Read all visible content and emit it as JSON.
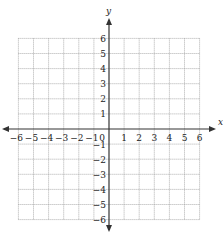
{
  "diagram": {
    "type": "coordinate-plane",
    "x_axis": {
      "label": "x",
      "min": -6,
      "max": 6,
      "ticks": [
        "-6",
        "-5",
        "-4",
        "-3",
        "-2",
        "-1",
        "1",
        "2",
        "3",
        "4",
        "5",
        "6"
      ],
      "origin_label": "0"
    },
    "y_axis": {
      "label": "y",
      "min": -6,
      "max": 6,
      "ticks": [
        "6",
        "5",
        "4",
        "3",
        "2",
        "1",
        "-1",
        "-2",
        "-3",
        "-4",
        "-5",
        "-6"
      ]
    },
    "grid": {
      "style": "dotted",
      "step": 1
    },
    "colors": {
      "axis": "#333333",
      "grid": "#9a9a9a",
      "text": "#222222"
    }
  }
}
